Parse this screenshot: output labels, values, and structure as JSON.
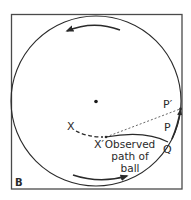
{
  "figure": {
    "panel_label": "B",
    "labels": {
      "x_start": "X",
      "x_prime": "X′",
      "p_prime": "P′",
      "p": "P",
      "q": "Q"
    },
    "caption_lines": [
      "Observed",
      "path of",
      "ball"
    ],
    "arrows": {
      "top": "counterclockwise (pointing left)",
      "bottom": "pointing right"
    },
    "colors": {
      "stroke": "#2a2a2a",
      "frame": "#4a4a4a",
      "dotted": "#555555",
      "background": "#ffffff"
    }
  }
}
